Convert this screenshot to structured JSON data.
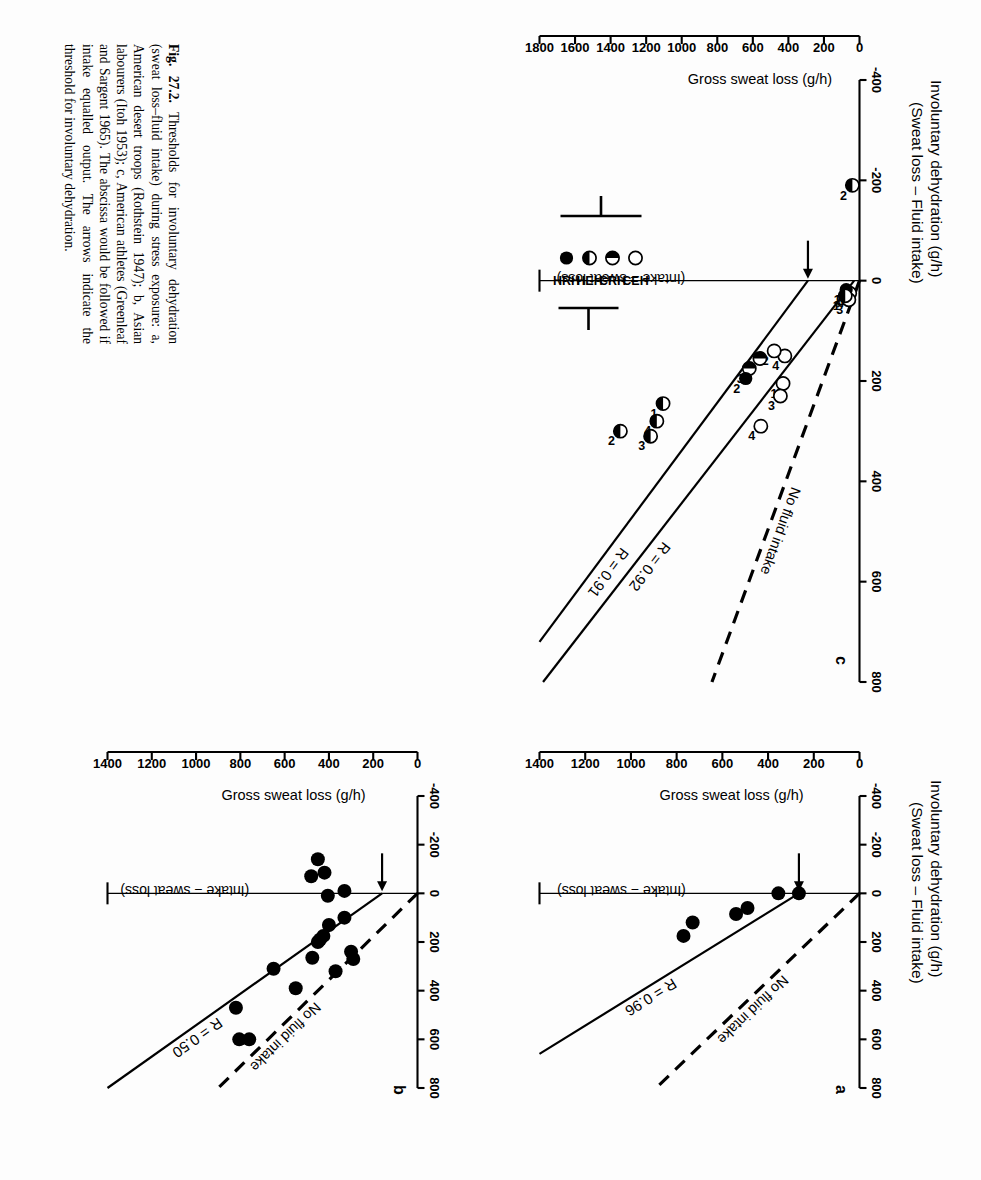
{
  "figure": {
    "number": "Fig. 27.2.",
    "caption": "Thresholds for involuntary dehydration (sweat loss–fluid intake) during stress exposure: a, American desert troops (Rothstein 1947); b, Asian labourers (Itoh 1953); c, American athletes (Greenleaf and Sargent 1965). The abscissa would be followed if intake equalled output. The arrows indicate the threshold for involuntary dehydration."
  },
  "axes": {
    "y_title_line1": "Involuntary dehydration (g/h)",
    "y_title_line2": "(Sweat loss – Fluid intake)",
    "x_title": "Gross sweat loss (g/h)",
    "y_ticks_ab": [
      "-400",
      "-200",
      "0",
      "200",
      "400",
      "600",
      "800"
    ],
    "y_ticks_c": [
      "-400",
      "-200",
      "0",
      "200",
      "400",
      "600",
      "800"
    ],
    "x_ticks_ab": [
      "0",
      "200",
      "400",
      "600",
      "800",
      "1000",
      "1200",
      "1400"
    ],
    "x_ticks_c": [
      "0",
      "200",
      "400",
      "600",
      "800",
      "1000",
      "1200",
      "1400",
      "1600",
      "1800"
    ]
  },
  "annotations": {
    "no_fluid_intake": "No fluid intake",
    "intake_equals_sweat": "(Intake = sweat loss)"
  },
  "legend": {
    "symbols": [
      "CEH",
      "CRH",
      "HEH",
      "HRH"
    ],
    "marker_kinds": [
      "open",
      "half-left",
      "half-bottom",
      "filled"
    ]
  },
  "chart_data": [
    {
      "type": "scatter",
      "panel": "a",
      "title": "American desert troops (Rothstein 1947)",
      "xlabel": "Gross sweat loss (g/h)",
      "ylabel": "Involuntary dehydration (g/h) (Sweat loss – Fluid intake)",
      "xlim": [
        0,
        1400
      ],
      "ylim": [
        -400,
        800
      ],
      "grid": false,
      "r_label": "R = 0.96",
      "r_value": 0.96,
      "arrow_threshold_x": 265,
      "points": [
        {
          "x": 265,
          "y": 0
        },
        {
          "x": 355,
          "y": 0
        },
        {
          "x": 490,
          "y": 60
        },
        {
          "x": 540,
          "y": 85
        },
        {
          "x": 730,
          "y": 120
        },
        {
          "x": 770,
          "y": 175
        }
      ],
      "lines": [
        {
          "name": "no-fluid-intake",
          "style": "dashed",
          "from": [
            0,
            0
          ],
          "to": [
            890,
            800
          ]
        },
        {
          "name": "regression",
          "style": "solid",
          "from": [
            265,
            0
          ],
          "to": [
            1400,
            660
          ]
        }
      ]
    },
    {
      "type": "scatter",
      "panel": "b",
      "title": "Asian labourers (Itoh 1953)",
      "xlabel": "Gross sweat loss (g/h)",
      "ylabel": "Involuntary dehydration (g/h) (Sweat loss – Fluid intake)",
      "xlim": [
        0,
        1400
      ],
      "ylim": [
        -400,
        800
      ],
      "grid": false,
      "r_label": "R = 0.50",
      "r_value": 0.5,
      "arrow_threshold_x": 160,
      "points": [
        {
          "x": 450,
          "y": -140
        },
        {
          "x": 420,
          "y": -85
        },
        {
          "x": 480,
          "y": -70
        },
        {
          "x": 330,
          "y": -10
        },
        {
          "x": 405,
          "y": 10
        },
        {
          "x": 330,
          "y": 100
        },
        {
          "x": 400,
          "y": 130
        },
        {
          "x": 425,
          "y": 175
        },
        {
          "x": 440,
          "y": 190
        },
        {
          "x": 450,
          "y": 200
        },
        {
          "x": 300,
          "y": 240
        },
        {
          "x": 290,
          "y": 270
        },
        {
          "x": 370,
          "y": 320
        },
        {
          "x": 475,
          "y": 265
        },
        {
          "x": 550,
          "y": 390
        },
        {
          "x": 650,
          "y": 310
        },
        {
          "x": 760,
          "y": 600
        },
        {
          "x": 805,
          "y": 600
        },
        {
          "x": 820,
          "y": 470
        }
      ],
      "lines": [
        {
          "name": "no-fluid-intake",
          "style": "dashed",
          "from": [
            0,
            0
          ],
          "to": [
            900,
            800
          ]
        },
        {
          "name": "regression",
          "style": "solid",
          "from": [
            160,
            0
          ],
          "to": [
            1400,
            800
          ]
        }
      ]
    },
    {
      "type": "scatter",
      "panel": "c",
      "title": "American athletes (Greenleaf and Sargent 1965)",
      "xlabel": "Gross sweat loss (g/h)",
      "ylabel": "Involuntary dehydration (g/h) (Sweat loss – Fluid intake)",
      "xlim": [
        0,
        1800
      ],
      "ylim": [
        -400,
        800
      ],
      "grid": false,
      "r_labels": [
        "R = 0.92",
        "R = 0.91"
      ],
      "r_values": [
        0.92,
        0.91
      ],
      "arrow_threshold_x": 290,
      "groups": [
        "CEH",
        "CRH",
        "HEH",
        "HRH"
      ],
      "points": [
        {
          "x": 40,
          "y": -190,
          "group": "HEH",
          "label": "2"
        },
        {
          "x": 55,
          "y": 25,
          "group": "CEH",
          "label": "4"
        },
        {
          "x": 60,
          "y": 38,
          "group": "CEH",
          "label": "3"
        },
        {
          "x": 75,
          "y": 18,
          "group": "HRH",
          "label": "1"
        },
        {
          "x": 80,
          "y": 30,
          "group": "HEH",
          "label": "1"
        },
        {
          "x": 420,
          "y": 150,
          "group": "CEH",
          "label": "4"
        },
        {
          "x": 430,
          "y": 205,
          "group": "CEH",
          "label": "1"
        },
        {
          "x": 445,
          "y": 230,
          "group": "CEH",
          "label": "3"
        },
        {
          "x": 480,
          "y": 140,
          "group": "CEH",
          "label": "2"
        },
        {
          "x": 560,
          "y": 155,
          "group": "CRH",
          "label": "1"
        },
        {
          "x": 620,
          "y": 175,
          "group": "CRH",
          "label": "3"
        },
        {
          "x": 640,
          "y": 195,
          "group": "HRH",
          "label": "2"
        },
        {
          "x": 555,
          "y": 290,
          "group": "CEH",
          "label": "4"
        },
        {
          "x": 1105,
          "y": 245,
          "group": "HEH",
          "label": "1"
        },
        {
          "x": 1140,
          "y": 280,
          "group": "HEH",
          "label": "4"
        },
        {
          "x": 1175,
          "y": 310,
          "group": "HEH",
          "label": "3"
        },
        {
          "x": 1345,
          "y": 300,
          "group": "HEH",
          "label": "2"
        }
      ],
      "lines": [
        {
          "name": "no-fluid-intake",
          "style": "dashed",
          "from": [
            0,
            0
          ],
          "to": [
            830,
            800
          ]
        },
        {
          "name": "regression-1",
          "style": "solid",
          "from": [
            30,
            0
          ],
          "to": [
            1780,
            800
          ]
        },
        {
          "name": "regression-2",
          "style": "solid",
          "from": [
            290,
            0
          ],
          "to": [
            1800,
            720
          ]
        }
      ]
    }
  ]
}
